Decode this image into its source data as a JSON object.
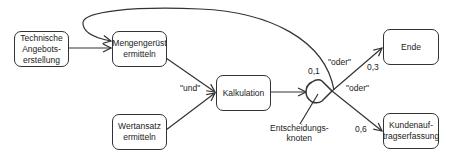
{
  "diagram": {
    "type": "process-flow",
    "nodes": [
      {
        "id": "technische",
        "label": "Technische\nAngebots-\nerstellung"
      },
      {
        "id": "mengengeruest",
        "label": "Mengengerüst\nermitteln"
      },
      {
        "id": "wertansatz",
        "label": "Wertansatz\nermitteln"
      },
      {
        "id": "kalkulation",
        "label": "Kalkulation"
      },
      {
        "id": "ende",
        "label": "Ende"
      },
      {
        "id": "kundenauftrag",
        "label": "Kundenauf-\ntragserfassung"
      }
    ],
    "decision_node": {
      "label": "Entscheidungs-\nknoten"
    },
    "edge_labels": {
      "und": "\"und\"",
      "oder_top": "\"oder\"",
      "oder_bottom": "\"oder\"",
      "prob_loop": "0,1",
      "prob_ende": "0,3",
      "prob_kunden": "0,6"
    },
    "edges": [
      {
        "from": "technische",
        "to": "mengengeruest"
      },
      {
        "from": "mengengeruest",
        "to": "kalkulation",
        "label": "\"und\""
      },
      {
        "from": "wertansatz",
        "to": "kalkulation",
        "label": "\"und\""
      },
      {
        "from": "kalkulation",
        "to": "decision"
      },
      {
        "from": "decision",
        "to": "ende",
        "probability": "0,3",
        "label": "\"oder\""
      },
      {
        "from": "decision",
        "to": "kundenauftrag",
        "probability": "0,6",
        "label": "\"oder\""
      },
      {
        "from": "decision",
        "to": "mengengeruest",
        "probability": "0,1"
      }
    ],
    "colors": {
      "stroke": "#333333",
      "background": "#ffffff"
    }
  }
}
